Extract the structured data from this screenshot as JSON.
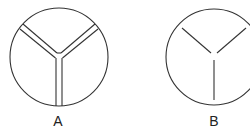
{
  "figures": [
    {
      "id": "A",
      "label": "A",
      "description": "circle divided into three segments with double-line separators"
    },
    {
      "id": "B",
      "label": "B",
      "description": "circle divided into three segments with single-line Y separator"
    }
  ],
  "colors": {
    "stroke": "#333333",
    "background": "#ffffff"
  }
}
